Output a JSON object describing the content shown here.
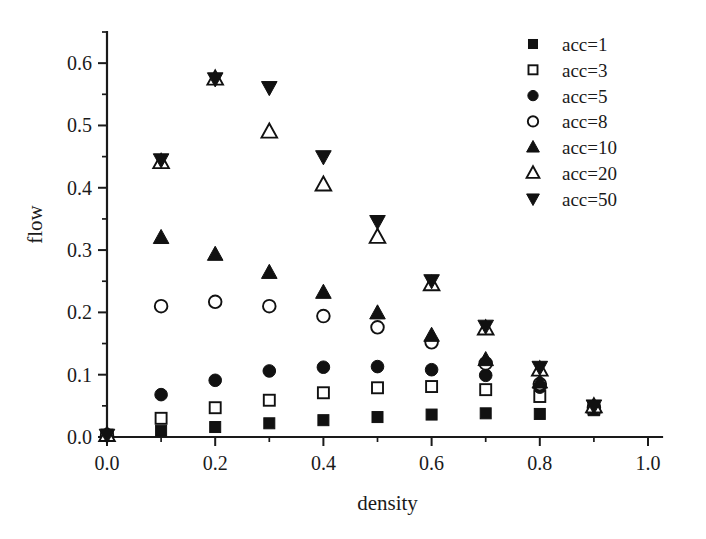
{
  "chart_data": {
    "type": "scatter",
    "title": "",
    "xlabel": "density",
    "ylabel": "flow",
    "xlim": [
      0.0,
      1.0
    ],
    "ylim": [
      0.0,
      0.65
    ],
    "grid": false,
    "legend_position": "top-right",
    "x_ticks": [
      "0.0",
      "0.2",
      "0.4",
      "0.6",
      "0.8",
      "1.0"
    ],
    "x_tick_values": [
      0.0,
      0.2,
      0.4,
      0.6,
      0.8,
      1.0
    ],
    "x_minor_tick_values": [
      0.1,
      0.3,
      0.5,
      0.7,
      0.9
    ],
    "y_ticks": [
      "0.0",
      "0.1",
      "0.2",
      "0.3",
      "0.4",
      "0.5",
      "0.6"
    ],
    "y_tick_values": [
      0.0,
      0.1,
      0.2,
      0.3,
      0.4,
      0.5,
      0.6
    ],
    "y_minor_tick_values": [
      0.05,
      0.15,
      0.25,
      0.35,
      0.45,
      0.55,
      0.65
    ],
    "x": [
      0.0,
      0.1,
      0.2,
      0.3,
      0.4,
      0.5,
      0.6,
      0.7,
      0.8,
      0.9
    ],
    "series": [
      {
        "name": "acc=1",
        "marker": "square-filled",
        "values": [
          0.003,
          0.01,
          0.016,
          0.022,
          0.027,
          0.032,
          0.036,
          0.038,
          0.037,
          0.043
        ]
      },
      {
        "name": "acc=3",
        "marker": "square-open",
        "values": [
          0.003,
          0.03,
          0.047,
          0.059,
          0.071,
          0.079,
          0.081,
          0.076,
          0.065,
          0.045
        ]
      },
      {
        "name": "acc=5",
        "marker": "circle-filled",
        "values": [
          0.003,
          0.068,
          0.091,
          0.106,
          0.112,
          0.113,
          0.108,
          0.099,
          0.08,
          0.046
        ]
      },
      {
        "name": "acc=8",
        "marker": "circle-open",
        "values": [
          0.003,
          0.21,
          0.217,
          0.21,
          0.194,
          0.176,
          0.152,
          0.118,
          0.085,
          0.047
        ]
      },
      {
        "name": "acc=10",
        "marker": "triangle-up-filled",
        "values": [
          0.003,
          0.32,
          0.293,
          0.264,
          0.232,
          0.199,
          0.163,
          0.124,
          0.088,
          0.048
        ]
      },
      {
        "name": "acc=20",
        "marker": "triangle-up-open",
        "values": [
          0.003,
          0.441,
          0.575,
          0.49,
          0.405,
          0.321,
          0.245,
          0.174,
          0.108,
          0.049
        ]
      },
      {
        "name": "acc=50",
        "marker": "triangle-down-filled",
        "values": [
          0.003,
          0.445,
          0.575,
          0.561,
          0.45,
          0.346,
          0.251,
          0.178,
          0.112,
          0.05
        ]
      }
    ]
  },
  "legend": {
    "entries": [
      {
        "label": "acc=1"
      },
      {
        "label": "acc=3"
      },
      {
        "label": "acc=5"
      },
      {
        "label": "acc=8"
      },
      {
        "label": "acc=10"
      },
      {
        "label": "acc=20"
      },
      {
        "label": "acc=50"
      }
    ]
  },
  "colors": {
    "ink": "#111111",
    "background": "#ffffff"
  }
}
